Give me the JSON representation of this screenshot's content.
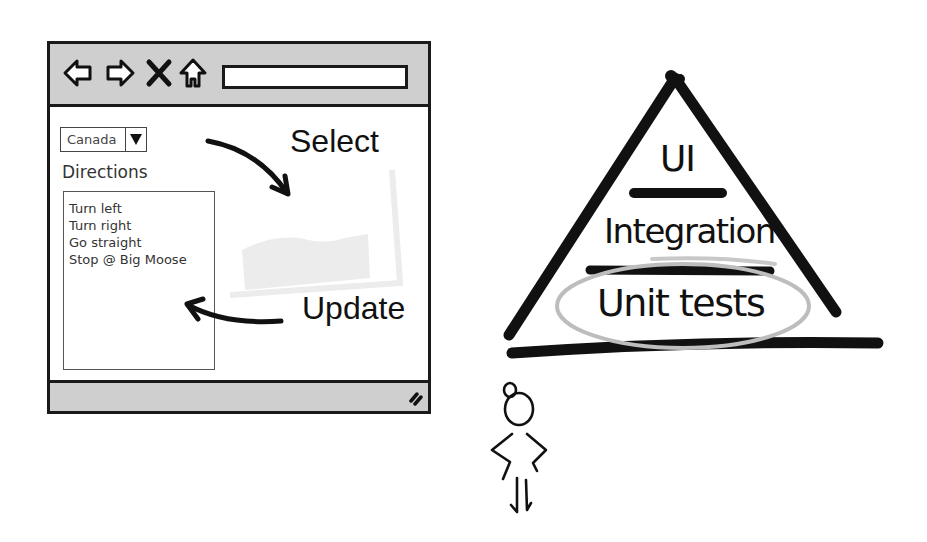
{
  "browser_mockup": {
    "toolbar": {
      "icons": [
        "back-arrow-icon",
        "forward-arrow-icon",
        "close-x-icon",
        "home-icon"
      ],
      "address_value": ""
    },
    "country_select": {
      "selected": "Canada"
    },
    "directions_label": "Directions",
    "directions": [
      "Turn left",
      "Turn right",
      "Go straight",
      "Stop @ Big Moose"
    ],
    "statusbar": {
      "icons": [
        "resize-grip-icon"
      ]
    }
  },
  "annotations": {
    "select": "Select",
    "update": "Update"
  },
  "pyramid": {
    "levels": [
      {
        "label": "UI",
        "highlighted": false
      },
      {
        "label": "Integration",
        "highlighted": false
      },
      {
        "label": "Unit tests",
        "highlighted": true
      }
    ],
    "highlight_color": "#bdbdbd",
    "stroke_color": "#111111"
  },
  "figure": {
    "icon": "stick-figure-icon"
  }
}
